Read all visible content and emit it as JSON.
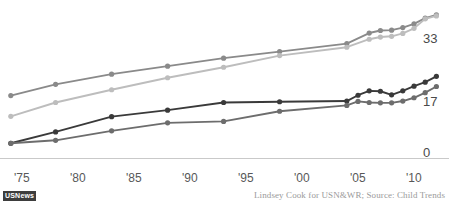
{
  "chart_data": {
    "type": "line",
    "title": "",
    "subtitle": "",
    "xlabel": "",
    "ylabel": "",
    "grid": false,
    "legend_position": "none",
    "xlim": [
      1974,
      2013
    ],
    "ylim": [
      0,
      42
    ],
    "y_ticks": [
      0,
      17,
      33
    ],
    "y_tick_labels": [
      "0",
      "17",
      "33"
    ],
    "x_ticks": [
      1975,
      1980,
      1985,
      1990,
      1995,
      2000,
      2005,
      2010
    ],
    "x_tick_labels": [
      "'75",
      "'80",
      "'85",
      "'90",
      "'95",
      "'00",
      "'05",
      "'10"
    ],
    "series": [
      {
        "name": "series-upper-gray",
        "color": "#8a8a8a",
        "x": [
          1974,
          1978,
          1983,
          1988,
          1993,
          1998,
          2004,
          2006,
          2007,
          2008,
          2009,
          2010,
          2011,
          2012
        ],
        "values": [
          17.3,
          20.4,
          23.2,
          25.4,
          27.6,
          29.4,
          31.6,
          34.5,
          35.2,
          35.3,
          36.0,
          37.0,
          38.6,
          39.5
        ]
      },
      {
        "name": "series-light-gray",
        "color": "#bdbdbd",
        "x": [
          1974,
          1978,
          1983,
          1988,
          1993,
          1998,
          2004,
          2006,
          2007,
          2008,
          2009,
          2010,
          2011,
          2012
        ],
        "values": [
          11.6,
          15.4,
          18.9,
          22.2,
          25.1,
          28.3,
          30.6,
          32.8,
          33.4,
          33.6,
          34.4,
          35.8,
          38.4,
          39.2
        ]
      },
      {
        "name": "series-dark",
        "color": "#3a3a3a",
        "x": [
          1974,
          1978,
          1983,
          1988,
          1993,
          1998,
          2004,
          2005,
          2006,
          2007,
          2008,
          2009,
          2010,
          2011,
          2012
        ],
        "values": [
          4.2,
          7.3,
          11.5,
          13.3,
          15.4,
          15.6,
          15.8,
          17.4,
          18.6,
          18.5,
          17.5,
          18.6,
          19.9,
          21.0,
          22.6
        ]
      },
      {
        "name": "series-mid-gray",
        "color": "#6d6d6d",
        "x": [
          1974,
          1978,
          1983,
          1988,
          1993,
          1998,
          2004,
          2005,
          2006,
          2007,
          2008,
          2009,
          2010,
          2011,
          2012
        ],
        "values": [
          4.2,
          5.0,
          7.6,
          9.8,
          10.2,
          13.0,
          14.6,
          15.7,
          15.4,
          15.3,
          15.3,
          15.8,
          16.7,
          18.1,
          19.8
        ]
      }
    ]
  },
  "footer": {
    "logo_label": "USNews",
    "credit": "Lindsey Cook for USN&WR; Source: Child Trends"
  },
  "colors": {
    "axis_line": "#c9c9c9",
    "y_label": "#4a4a4a",
    "x_label": "#585858",
    "credit": "#9a9a9a",
    "logo_background": "#3d3d3d"
  }
}
